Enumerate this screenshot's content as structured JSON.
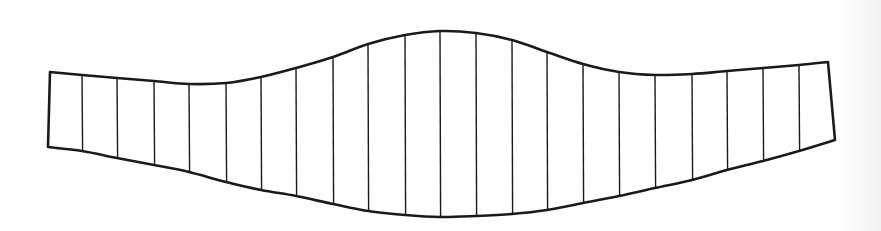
{
  "diagram": {
    "type": "sectioned-band",
    "stroke_color": "#1a1a1a",
    "background_color": "#ffffff",
    "outline_stroke_width": 2.6,
    "divider_stroke_width": 1.4,
    "left_edge": {
      "top": [
        50,
        72
      ],
      "bottom": [
        48,
        147
      ]
    },
    "right_edge": {
      "top": [
        828,
        62
      ],
      "bottom": [
        835,
        140
      ]
    },
    "top_curve_points": [
      [
        50,
        72
      ],
      [
        82,
        75
      ],
      [
        117,
        78
      ],
      [
        154,
        81
      ],
      [
        189,
        84
      ],
      [
        226,
        83
      ],
      [
        261,
        77
      ],
      [
        296,
        68
      ],
      [
        333,
        57
      ],
      [
        368,
        44
      ],
      [
        405,
        35
      ],
      [
        440,
        31
      ],
      [
        476,
        33
      ],
      [
        512,
        40
      ],
      [
        547,
        52
      ],
      [
        583,
        64
      ],
      [
        619,
        72
      ],
      [
        655,
        75
      ],
      [
        692,
        74
      ],
      [
        727,
        71
      ],
      [
        763,
        68
      ],
      [
        799,
        65
      ],
      [
        828,
        62
      ]
    ],
    "bottom_curve_points": [
      [
        48,
        147
      ],
      [
        82,
        151
      ],
      [
        117,
        158
      ],
      [
        154,
        165
      ],
      [
        189,
        172
      ],
      [
        226,
        182
      ],
      [
        261,
        190
      ],
      [
        296,
        196
      ],
      [
        333,
        204
      ],
      [
        368,
        211
      ],
      [
        405,
        215
      ],
      [
        440,
        217
      ],
      [
        476,
        216
      ],
      [
        512,
        214
      ],
      [
        547,
        210
      ],
      [
        583,
        203
      ],
      [
        619,
        196
      ],
      [
        655,
        188
      ],
      [
        692,
        180
      ],
      [
        727,
        170
      ],
      [
        763,
        161
      ],
      [
        799,
        151
      ],
      [
        835,
        140
      ]
    ],
    "divider_x_positions": [
      82,
      117,
      154,
      189,
      226,
      261,
      296,
      333,
      368,
      405,
      440,
      476,
      512,
      547,
      583,
      619,
      655,
      692,
      727,
      763,
      799
    ],
    "divider_count": 21,
    "strip_count": 22
  }
}
